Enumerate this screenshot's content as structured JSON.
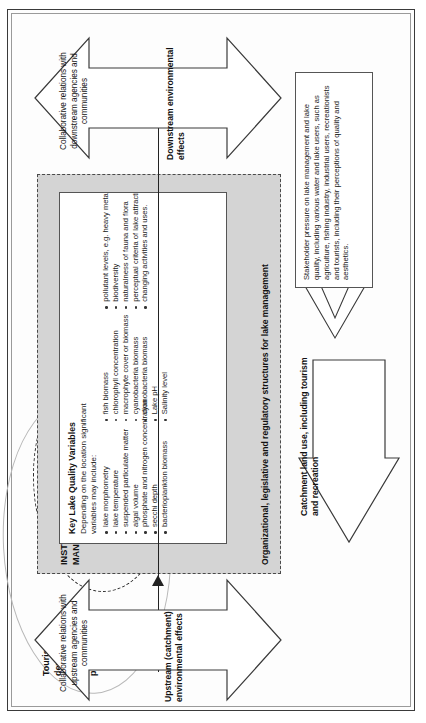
{
  "figure": {
    "institutional_panel": {
      "title": "INSTITUTIONAL ARRANGEMENTS FOR LAKE MANAGEMENT",
      "footer": "Organizational, legislative and regulatory structures for lake management"
    },
    "variables_box": {
      "title": "Key Lake Quality Variables",
      "intro": "Depending on the location significant variables may include:",
      "items": [
        "lake morphometry",
        "lake temperature",
        "suspended particulate matter",
        "algal volume",
        "phosphate and nitrogen concentration",
        "secchi depth",
        "bacterioplankton biomass",
        "fish biomass",
        "chlorophyll concentration",
        "macrophyte cover or biomass",
        "cyanobacteria biomass",
        "cyanobacteria biomass",
        "Lake pH",
        "Salinity level",
        "pollutant levels, e.g. heavy metals",
        "biodiversity",
        "naturalness of fauna and flora",
        "perceptual criteria of lake attractiveness",
        "changing activities and uses."
      ]
    },
    "ellipses": {
      "tourism_label": "Tourism development, marketing, management and promotion",
      "lake_communities_label": "Lake communities"
    },
    "arrows": {
      "upstream": {
        "label": "Collaborative relations with upstream agencies and communities",
        "caption": "Upstream (catchment) environmental effects"
      },
      "downstream": {
        "label": "Collaborative relations with downstream agencies and communities",
        "caption": "Downstream environmental effects"
      },
      "catchment": {
        "caption": "Catchment land use, including tourism and recreation"
      }
    },
    "stakeholder_box": {
      "text": "Stakeholder pressure on lake management and lake quality, including various water and lake users, such as agriculture, fishing industry, industrial users, recreationists and tourists, including their perceptions of quality and aesthetics."
    },
    "colors": {
      "panel_fill": "#d4d4d4",
      "box_fill": "#ffffff",
      "line": "#222222",
      "text": "#111111"
    }
  }
}
